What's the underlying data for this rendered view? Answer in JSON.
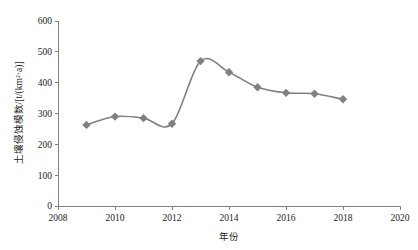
{
  "chart_data": {
    "type": "line",
    "title": "",
    "subtitle": "",
    "xlabel": "年份",
    "ylabel": "土壤侵蚀模数/[t/(km²·a)]",
    "x": [
      2009,
      2010,
      2011,
      2012,
      2013,
      2014,
      2015,
      2016,
      2017,
      2018
    ],
    "values": [
      263,
      290,
      285,
      267,
      470,
      434,
      385,
      367,
      364,
      346
    ],
    "series": [
      {
        "name": "土壤侵蚀模数",
        "values": [
          263,
          290,
          285,
          267,
          470,
          434,
          385,
          367,
          364,
          346
        ]
      }
    ],
    "xlim": [
      2008,
      2020
    ],
    "ylim": [
      0,
      600
    ],
    "xticks": [
      2008,
      2010,
      2012,
      2014,
      2016,
      2018,
      2020
    ],
    "xtick_labels": [
      "2008",
      "2010",
      "2012",
      "2014",
      "2016",
      "2018",
      "2020"
    ],
    "yticks": [
      0,
      100,
      200,
      300,
      400,
      500,
      600
    ],
    "ytick_labels": [
      "0",
      "100",
      "200",
      "300",
      "400",
      "500",
      "600"
    ],
    "grid": false,
    "legend": false,
    "legend_position": "none",
    "smooth": true,
    "marker": "diamond",
    "series_color": "#808080",
    "axis_color": "#808080",
    "text_color": "#1a1a1a"
  },
  "axes": {
    "y_axis_title": "土壤侵蚀模数/[t/(km²·a)]",
    "x_axis_title": "年份"
  }
}
